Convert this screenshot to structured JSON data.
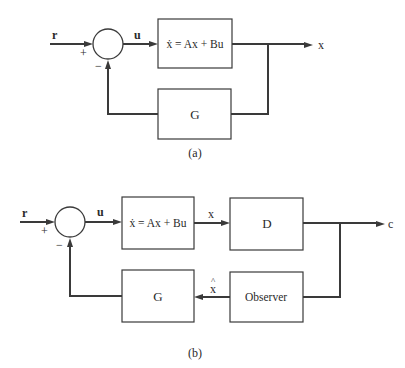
{
  "diagram_a": {
    "caption": "(a)",
    "input_label": "r",
    "plus_sign": "+",
    "minus_sign": "−",
    "control_label": "u",
    "plant_block": "ẋ = Ax + Bu",
    "feedback_block": "G",
    "output_label": "x"
  },
  "diagram_b": {
    "caption": "(b)",
    "input_label": "r",
    "plus_sign": "+",
    "minus_sign": "−",
    "control_label": "u",
    "plant_block": "ẋ = Ax + Bu",
    "state_label": "x",
    "output_block": "D",
    "output_label": "c",
    "observer_block": "Observer",
    "estimate_label": "x̂",
    "estimate_hat": "^",
    "estimate_base": "x",
    "feedback_block": "G"
  },
  "colors": {
    "line": "#3a3a3a",
    "text": "#2a2a2a",
    "background": "#ffffff"
  }
}
